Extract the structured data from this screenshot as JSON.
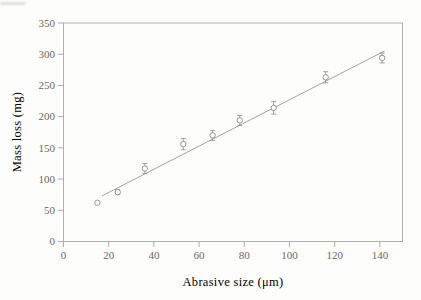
{
  "figure": {
    "background": "#fdfdfc"
  },
  "chart_data": {
    "type": "scatter",
    "title": "",
    "xlabel": "Abrasive size (μm)",
    "ylabel": "Mass loss (mg)",
    "xlim": [
      0,
      150
    ],
    "ylim": [
      0,
      350
    ],
    "x_ticks": [
      0,
      20,
      40,
      60,
      80,
      100,
      120,
      140
    ],
    "y_ticks": [
      0,
      50,
      100,
      150,
      200,
      250,
      300,
      350
    ],
    "grid": false,
    "legend": "none",
    "marker": "open-circle",
    "series": [
      {
        "name": "mass-loss-measurements",
        "points": [
          {
            "x": 15,
            "y": 62,
            "yerr": 0
          },
          {
            "x": 24,
            "y": 79,
            "yerr": 4
          },
          {
            "x": 36,
            "y": 117,
            "yerr": 8
          },
          {
            "x": 53,
            "y": 156,
            "yerr": 9
          },
          {
            "x": 66,
            "y": 170,
            "yerr": 8
          },
          {
            "x": 78,
            "y": 194,
            "yerr": 8
          },
          {
            "x": 93,
            "y": 214,
            "yerr": 10
          },
          {
            "x": 116,
            "y": 263,
            "yerr": 9
          },
          {
            "x": 141,
            "y": 294,
            "yerr": 8
          }
        ]
      }
    ],
    "fit_line": {
      "name": "linear-fit",
      "x1": 17,
      "y1": 73,
      "x2": 142,
      "y2": 305
    },
    "colors": {
      "frame": "#b4b1ac",
      "tick": "#aeaba6",
      "tick_label": "#6d6862",
      "axis_title": "#5e5954",
      "marker_stroke": "#918d88",
      "error_bar": "#918d88",
      "fit_line": "#9b9790"
    }
  }
}
